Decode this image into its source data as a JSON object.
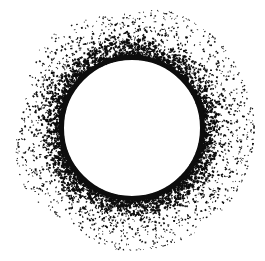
{
  "canvas": {
    "width": 265,
    "height": 261,
    "background_color": "#ffffff",
    "ink_color": "#0d0d0d",
    "title": "Stippled Ring"
  },
  "artwork": {
    "name": "particle-ring",
    "description": "Solid black annulus surrounded by a decaying corona of small black dash particles",
    "center_x": 132,
    "center_y": 128,
    "solid_ring": {
      "inner_radius": 68,
      "outer_radius": 73,
      "stroke_color": "#0d0d0d",
      "stroke_width": 5
    },
    "particle_field": {
      "inner_radius": 70,
      "outer_radius": 122,
      "count": 4200,
      "min_size": 1,
      "max_size": 3.4,
      "color": "#0d0d0d",
      "density_falloff": "exponential",
      "falloff_exponent": 2.6,
      "seed": 20240611,
      "angular_modulation": 0.22
    }
  }
}
